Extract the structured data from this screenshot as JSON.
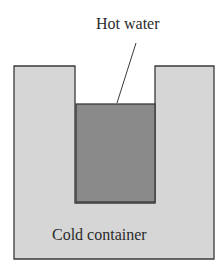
{
  "diagram": {
    "hot_label": "Hot water",
    "cold_label": "Cold container",
    "colors": {
      "cold_fill": "#d6d6d6",
      "hot_fill": "#8a8a8a",
      "outline": "#3a3a3a",
      "background": "#ffffff"
    }
  }
}
